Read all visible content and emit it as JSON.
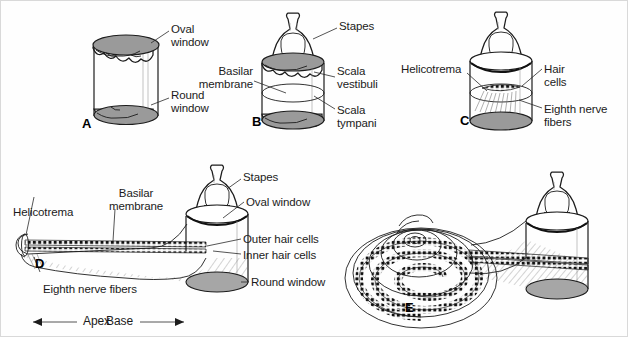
{
  "figure": {
    "background_color": "#fefefe",
    "membrane_color": "#9a9a9a",
    "line_color": "#1c1c1c"
  },
  "panels": [
    {
      "id": "A",
      "letter": "A",
      "labels": [
        {
          "name": "oval-window",
          "text": "Oval\nwindow"
        },
        {
          "name": "round-window",
          "text": "Round\nwindow"
        }
      ]
    },
    {
      "id": "B",
      "letter": "B",
      "labels": [
        {
          "name": "stapes",
          "text": "Stapes"
        },
        {
          "name": "basilar-membrane",
          "text": "Basilar\nmembrane"
        },
        {
          "name": "scala-vestibuli",
          "text": "Scala\nvestibuli"
        },
        {
          "name": "scala-tympani",
          "text": "Scala\ntympani"
        }
      ]
    },
    {
      "id": "C",
      "letter": "C",
      "labels": [
        {
          "name": "helicotrema",
          "text": "Helicotrema"
        },
        {
          "name": "hair-cells",
          "text": "Hair\ncells"
        },
        {
          "name": "eighth-nerve-fibers",
          "text": "Eighth nerve\nfibers"
        }
      ]
    },
    {
      "id": "D",
      "letter": "D",
      "labels": [
        {
          "name": "helicotrema",
          "text": "Helicotrema"
        },
        {
          "name": "basilar-membrane",
          "text": "Basilar\nmembrane"
        },
        {
          "name": "stapes",
          "text": "Stapes"
        },
        {
          "name": "oval-window",
          "text": "Oval window"
        },
        {
          "name": "outer-hair-cells",
          "text": "Outer hair cells"
        },
        {
          "name": "inner-hair-cells",
          "text": "Inner hair cells"
        },
        {
          "name": "round-window",
          "text": "Round window"
        },
        {
          "name": "eighth-nerve-fibers",
          "text": "Eighth nerve fibers"
        }
      ],
      "axis": {
        "apex": "Apex",
        "base": "Base"
      }
    },
    {
      "id": "E",
      "letter": "E",
      "labels": []
    }
  ],
  "text": {
    "a_oval_window": "Oval\nwindow",
    "a_round_window": "Round\nwindow",
    "a_letter": "A",
    "b_stapes": "Stapes",
    "b_basilar_membrane": "Basilar\nmembrane",
    "b_scala_vestibuli": "Scala\nvestibuli",
    "b_scala_tympani": "Scala\ntympani",
    "b_letter": "B",
    "c_helicotrema": "Helicotrema",
    "c_hair_cells": "Hair\ncells",
    "c_eighth_nerve": "Eighth nerve\nfibers",
    "c_letter": "C",
    "d_helicotrema": "Helicotrema",
    "d_basilar_membrane": "Basilar\nmembrane",
    "d_stapes": "Stapes",
    "d_oval_window": "Oval window",
    "d_outer_hair_cells": "Outer hair cells",
    "d_inner_hair_cells": "Inner hair cells",
    "d_round_window": "Round window",
    "d_eighth_nerve": "Eighth nerve fibers",
    "d_apex": "Apex",
    "d_base": "Base",
    "d_letter": "D",
    "e_letter": "E"
  }
}
